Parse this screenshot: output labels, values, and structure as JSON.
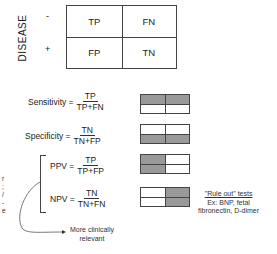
{
  "matrix": {
    "axis_label": "DISEASE",
    "row_signs": [
      "-",
      "+"
    ],
    "cells": [
      [
        "TP",
        "FN"
      ],
      [
        "FP",
        "TN"
      ]
    ]
  },
  "formulas": [
    {
      "name": "Sensitivity =",
      "numerator": "TP",
      "denominator": "TP+FN",
      "shaded": [
        true,
        true,
        false,
        false
      ]
    },
    {
      "name": "Specificity =",
      "numerator": "TN",
      "denominator": "TN+FP",
      "shaded": [
        false,
        false,
        true,
        true
      ]
    },
    {
      "name": "PPV =",
      "numerator": "TP",
      "denominator": "TP+FP",
      "shaded": [
        true,
        false,
        true,
        false
      ]
    },
    {
      "name": "NPV =",
      "numerator": "TN",
      "denominator": "TN+FN",
      "shaded": [
        false,
        true,
        false,
        true
      ]
    }
  ],
  "annotations": {
    "clinical": "More clinically relevant",
    "clinical_line1": "More clinically",
    "clinical_line2": "relevant",
    "rule_out_title": "\"Rule out\" tests",
    "rule_out_line2": "Ex: BNP, fetal",
    "rule_out_line3": "fibronectin, D-dimer",
    "left_fragment": "r\n;\n/\n-\ne"
  },
  "colors": {
    "shade": "#999999",
    "line": "#444444"
  }
}
